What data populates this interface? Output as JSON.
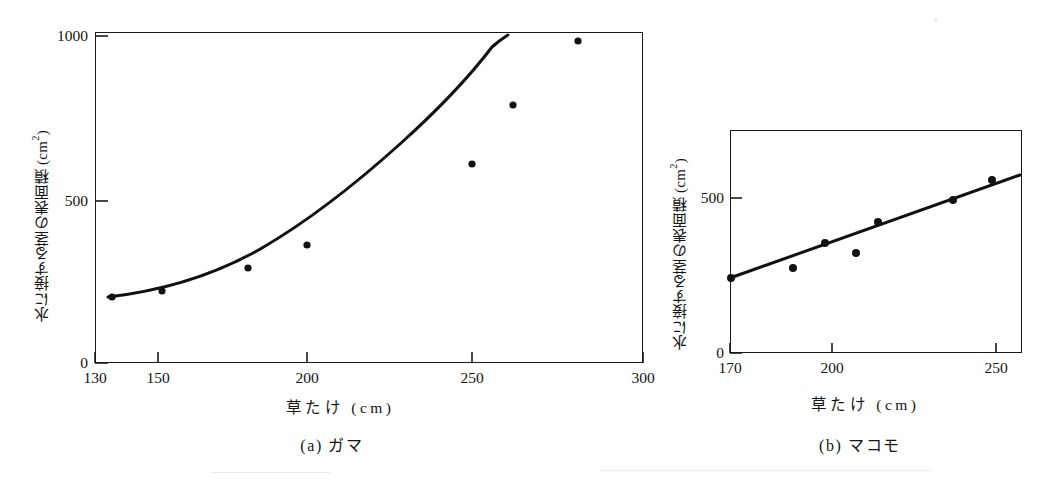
{
  "figure": {
    "background_color": "#ffffff",
    "ink_color": "#141414"
  },
  "chart_data": [
    {
      "type": "scatter",
      "panel_id": "(a)",
      "title": "ガマ",
      "caption": "(a) ガマ",
      "xlabel": "草たけ (cm)",
      "ylabel": "水に接する茎の表面積 (cm²)",
      "xlim": [
        130,
        300
      ],
      "ylim": [
        0,
        1000
      ],
      "xticks": [
        130,
        150,
        200,
        250,
        300
      ],
      "xtick_labels": [
        "130",
        "150",
        "200",
        "250",
        "300"
      ],
      "yticks": [
        0,
        500,
        1000
      ],
      "ytick_labels": [
        "0",
        "500",
        "1000"
      ],
      "grid": false,
      "legend": "none",
      "series": [
        {
          "name": "観測点",
          "marker": "filled-circle",
          "x": [
            136,
            152,
            180,
            200,
            250,
            263,
            285
          ],
          "y": [
            205,
            222,
            290,
            360,
            610,
            790,
            980
          ]
        },
        {
          "name": "回帰曲線",
          "marker": "none",
          "line": "solid",
          "x": [
            132,
            150,
            170,
            190,
            210,
            230,
            250,
            265,
            275,
            285
          ],
          "y": [
            200,
            220,
            252,
            300,
            365,
            448,
            552,
            650,
            730,
            985
          ]
        }
      ]
    },
    {
      "type": "scatter",
      "panel_id": "(b)",
      "title": "マコモ",
      "caption": "(b) マコモ",
      "xlabel": "草たけ (cm)",
      "ylabel": "水に接する茎の表面積 (cm²)",
      "xlim": [
        170,
        256
      ],
      "ylim": [
        0,
        640
      ],
      "xticks": [
        170,
        200,
        250
      ],
      "xtick_labels": [
        "170",
        "200",
        "250"
      ],
      "yticks": [
        0,
        500
      ],
      "ytick_labels": [
        "0",
        "500"
      ],
      "grid": false,
      "legend": "none",
      "series": [
        {
          "name": "観測点",
          "marker": "filled-circle",
          "x": [
            170,
            191,
            200,
            208,
            214,
            240,
            252
          ],
          "y": [
            237,
            278,
            348,
            315,
            423,
            487,
            555
          ]
        },
        {
          "name": "回帰直線",
          "marker": "none",
          "line": "solid",
          "x": [
            170,
            255
          ],
          "y": [
            240,
            570
          ]
        }
      ]
    }
  ]
}
